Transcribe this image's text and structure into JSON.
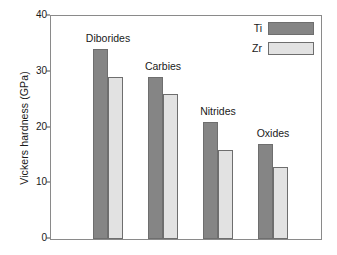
{
  "chart_data": {
    "type": "bar",
    "title": "",
    "xlabel": "",
    "ylabel": "Vickers hardness (GPa)",
    "categories": [
      "Diborides",
      "Carbies",
      "Nitrides",
      "Oxides"
    ],
    "series": [
      {
        "name": "Ti",
        "color": "#858585",
        "values": [
          34,
          29,
          21,
          17
        ]
      },
      {
        "name": "Zr",
        "color": "#e2e2e2",
        "values": [
          29,
          26,
          16,
          13
        ]
      }
    ],
    "ylim": [
      0,
      40
    ],
    "yticks": [
      0,
      10,
      20,
      30,
      40
    ],
    "ytick_labels": [
      "0",
      "10",
      "20",
      "30",
      "40"
    ],
    "grid": false,
    "legend_position": "top-right",
    "legend_entries": [
      "Ti",
      "Zr"
    ],
    "category_labels_position": "above-bars"
  }
}
